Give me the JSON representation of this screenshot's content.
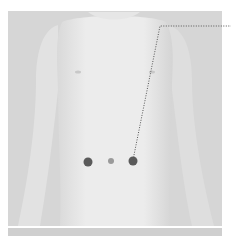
{
  "figure": {
    "colors": {
      "background": "#ffffff",
      "photo_bg": "#d6d6d6",
      "skin": "#ebebeb",
      "skin_shadow": "#c4c4c4",
      "marker": "#5a5a5a",
      "navel": "#8f8f8f",
      "leader_line": "#555555"
    },
    "markers": [
      {
        "name": "left-point",
        "cx": 88,
        "cy": 162,
        "r": 4.5
      },
      {
        "name": "navel",
        "cx": 111,
        "cy": 161,
        "r": 3
      },
      {
        "name": "right-point",
        "cx": 133,
        "cy": 161,
        "r": 4.5
      }
    ],
    "leader": {
      "points": "133,160 160,26 231,26"
    }
  }
}
